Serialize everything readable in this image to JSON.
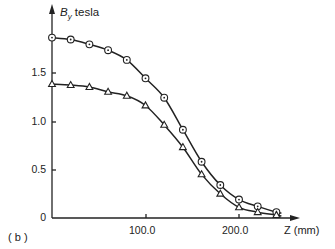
{
  "chart_data": {
    "type": "line",
    "title": "",
    "panel_label": "(b)",
    "xlabel": "Z (mm)",
    "ylabel": "B_y tesla",
    "xlim": [
      0,
      260
    ],
    "ylim": [
      0,
      2.0
    ],
    "x_ticks": [
      100.0,
      200.0
    ],
    "x_tick_labels": [
      "100.0",
      "200.0"
    ],
    "y_ticks": [
      0,
      0.5,
      1.0,
      1.5
    ],
    "y_tick_labels": [
      "0",
      "0.5",
      "1.0",
      "1.5"
    ],
    "grid": false,
    "legend": null,
    "x": [
      0,
      20,
      40,
      60,
      80,
      100,
      120,
      140,
      160,
      180,
      200,
      220,
      240
    ],
    "series": [
      {
        "name": "circles",
        "marker": "circle-dot",
        "values": [
          1.86,
          1.84,
          1.79,
          1.73,
          1.63,
          1.44,
          1.24,
          0.91,
          0.58,
          0.34,
          0.19,
          0.12,
          0.06
        ]
      },
      {
        "name": "triangles",
        "marker": "triangle",
        "values": [
          1.38,
          1.37,
          1.35,
          1.3,
          1.26,
          1.16,
          0.96,
          0.73,
          0.45,
          0.25,
          0.11,
          0.06,
          0.03
        ]
      }
    ]
  },
  "labels": {
    "y_axis_title_main": "B",
    "y_axis_title_sub": "y",
    "y_axis_title_unit": " tesla",
    "x_axis_title": "Z (mm)",
    "panel": "( b )",
    "tick_0": "0",
    "tick_05": "0.5",
    "tick_10": "1.0",
    "tick_15": "1.5",
    "tick_100": "100.0",
    "tick_200": "200.0"
  }
}
